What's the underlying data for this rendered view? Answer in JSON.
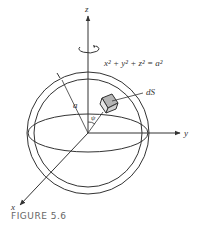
{
  "figure": {
    "caption": "FIGURE 5.6",
    "equation": "x² + y² + z² = a²",
    "labels": {
      "z_axis": "z",
      "y_axis": "y",
      "x_axis": "x",
      "radius": "a",
      "surface_element": "dS",
      "angle": "ψ"
    },
    "colors": {
      "line": "#333333",
      "element_fill": "#b5b5b5",
      "caption": "#666666"
    }
  }
}
